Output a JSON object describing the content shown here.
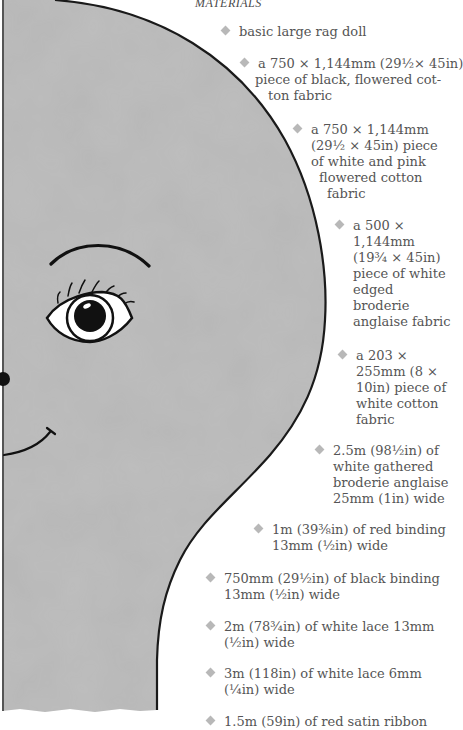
{
  "heading": "MATERIALS",
  "colors": {
    "head_fill": "#b5b5b5",
    "outline": "#1a1a1a",
    "text": "#555555",
    "bullet": "#b8b8b8"
  },
  "illustration": {
    "subject": "rag doll face template",
    "features": [
      "head-outline",
      "eyebrow",
      "eye",
      "eyelashes",
      "cheek-dot",
      "smile",
      "neck"
    ]
  },
  "materials": [
    {
      "lines": [
        "basic large rag doll"
      ]
    },
    {
      "lines": [
        "a 750 × 1,144mm (29½× 45in)",
        "piece of black, flowered cot-",
        "ton fabric"
      ]
    },
    {
      "lines": [
        "a 750 × 1,144mm",
        "(29½ × 45in) piece",
        "of white and pink",
        "flowered cotton",
        "fabric"
      ]
    },
    {
      "lines": [
        "a 500 ×",
        "1,144mm",
        "(19¾ × 45in)",
        "piece of white",
        "edged",
        "broderie",
        "anglaise fabric"
      ]
    },
    {
      "lines": [
        "a 203 ×",
        "255mm (8 ×",
        "10in) piece of",
        "white cotton",
        "fabric"
      ]
    },
    {
      "lines": [
        "2.5m (98½in) of",
        "white gathered",
        "broderie anglaise",
        "25mm (1in) wide"
      ]
    },
    {
      "lines": [
        "1m (39⅜in) of red binding",
        "13mm (½in) wide"
      ]
    },
    {
      "lines": [
        "750mm (29½in) of black binding",
        "13mm (½in) wide"
      ]
    },
    {
      "lines": [
        "2m (78¾in) of white lace 13mm",
        "(½in) wide"
      ]
    },
    {
      "lines": [
        "3m (118in) of white lace 6mm",
        "(¼in) wide"
      ]
    },
    {
      "lines": [
        "1.5m (59in) of red satin ribbon"
      ]
    }
  ]
}
